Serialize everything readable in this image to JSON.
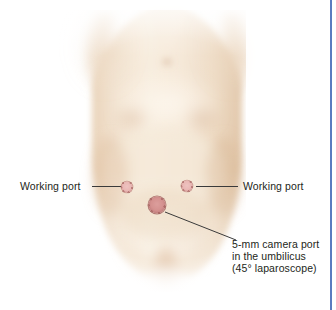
{
  "figure": {
    "background_color": "#ffffff",
    "border_color": "#5b7cc0",
    "skin_colors": {
      "highlight": "#faf0e4",
      "midtone": "#f2e2cf",
      "shadow": "#e5cdb3",
      "deep_shadow": "#d9bb9e"
    }
  },
  "ports": [
    {
      "id": "working-port-left",
      "label": "Working port",
      "type": "working",
      "x": 127,
      "y": 187,
      "diameter": 11,
      "color": "#e9b7b4"
    },
    {
      "id": "camera-port-umbilical",
      "label": "5-mm camera port",
      "type": "camera",
      "x": 157,
      "y": 205,
      "diameter": 17,
      "color": "#d4918f"
    },
    {
      "id": "working-port-right",
      "label": "Working port",
      "type": "working",
      "x": 187,
      "y": 186,
      "diameter": 11,
      "color": "#e9b7b4"
    }
  ],
  "annotations": {
    "left_label": "Working port",
    "right_label": "Working port",
    "camera_caption": {
      "line1": "5-mm camera port",
      "line2": "in the umbilicus",
      "line3": "(45° laparoscope)"
    }
  }
}
